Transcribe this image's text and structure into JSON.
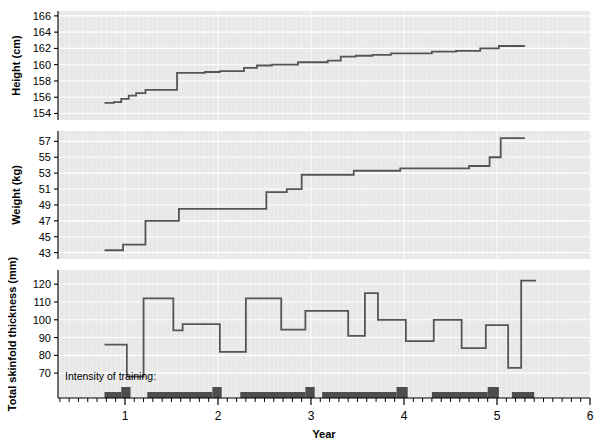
{
  "figure": {
    "background": "#ffffff",
    "panel_background": "#e8e8e8",
    "gridline_color": "#f7f7f7",
    "line_color": "#555555",
    "bar_color": "#4d4d4d",
    "axis_color": "#000000",
    "annotation": "Intensity of training:",
    "xlabel": "Year"
  },
  "chart_data": [
    {
      "type": "line",
      "id": "height",
      "title": "",
      "ylabel": "Height (cm)",
      "xlabel": "Year",
      "ylim": [
        153.2,
        166.6
      ],
      "xlim": [
        0.28,
        6.0
      ],
      "yticks": [
        154,
        156,
        158,
        160,
        162,
        164,
        166
      ],
      "grid": true,
      "drawstyle": "steps-post",
      "x": [
        0.78,
        0.88,
        0.96,
        1.04,
        1.12,
        1.22,
        1.34,
        1.56,
        1.74,
        1.86,
        2.02,
        2.14,
        2.28,
        2.42,
        2.58,
        2.74,
        2.86,
        2.96,
        3.06,
        3.18,
        3.32,
        3.48,
        3.66,
        3.86,
        4.06,
        4.3,
        4.56,
        4.82,
        5.02,
        5.16
      ],
      "y": [
        155.3,
        155.4,
        155.8,
        156.2,
        156.5,
        156.9,
        156.9,
        159.0,
        159.0,
        159.1,
        159.2,
        159.2,
        159.6,
        159.9,
        160.0,
        160.0,
        160.3,
        160.3,
        160.3,
        160.5,
        161.0,
        161.1,
        161.2,
        161.4,
        161.4,
        161.6,
        161.7,
        162.0,
        162.3,
        162.3
      ]
    },
    {
      "type": "line",
      "id": "weight",
      "title": "",
      "ylabel": "Weight (kg)",
      "xlabel": "Year",
      "ylim": [
        42.2,
        58.3
      ],
      "xlim": [
        0.28,
        6.0
      ],
      "yticks": [
        43,
        45,
        47,
        49,
        51,
        53,
        55,
        57
      ],
      "grid": true,
      "drawstyle": "steps-post",
      "x": [
        0.78,
        0.9,
        0.98,
        1.22,
        1.36,
        1.58,
        1.76,
        1.96,
        2.26,
        2.52,
        2.74,
        2.9,
        3.04,
        3.22,
        3.46,
        3.72,
        3.96,
        4.22,
        4.46,
        4.7,
        4.92,
        5.04,
        5.16
      ],
      "y": [
        43.3,
        43.3,
        44.0,
        47.0,
        47.0,
        48.5,
        48.5,
        48.5,
        48.5,
        50.6,
        51.0,
        52.8,
        52.8,
        52.8,
        53.3,
        53.3,
        53.6,
        53.6,
        53.6,
        53.9,
        55.0,
        57.4,
        57.4
      ]
    },
    {
      "type": "line",
      "id": "skinfold",
      "title": "",
      "ylabel": "Total skinfold thickness (mm)",
      "xlabel": "Year",
      "ylim": [
        56,
        128
      ],
      "xlim": [
        0.28,
        6.0
      ],
      "yticks": [
        70,
        80,
        90,
        100,
        110,
        120
      ],
      "grid": true,
      "drawstyle": "steps-post",
      "x": [
        0.78,
        0.94,
        1.02,
        1.2,
        1.34,
        1.52,
        1.62,
        1.94,
        2.02,
        2.14,
        2.3,
        2.48,
        2.68,
        2.78,
        2.94,
        3.06,
        3.24,
        3.4,
        3.58,
        3.72,
        3.88,
        4.02,
        4.16,
        4.32,
        4.46,
        4.62,
        4.88,
        4.98,
        5.12,
        5.26
      ],
      "y": [
        86,
        86,
        68,
        112,
        112,
        94,
        97.5,
        97.5,
        82,
        82,
        112,
        112,
        94.5,
        94.5,
        105,
        105,
        105,
        91,
        115,
        100,
        100,
        88,
        88,
        100,
        100,
        84,
        97,
        97,
        73,
        122
      ]
    },
    {
      "type": "bar",
      "id": "training-intensity",
      "title": "Intensity of training:",
      "xlabel": "Year",
      "xlim": [
        0.28,
        6.0
      ],
      "bars": [
        {
          "x0": 0.78,
          "x1": 0.96,
          "level": 1
        },
        {
          "x0": 0.96,
          "x1": 1.06,
          "level": 2
        },
        {
          "x0": 1.24,
          "x1": 1.94,
          "level": 1
        },
        {
          "x0": 1.94,
          "x1": 2.04,
          "level": 2
        },
        {
          "x0": 2.24,
          "x1": 2.94,
          "level": 1
        },
        {
          "x0": 2.94,
          "x1": 3.04,
          "level": 2
        },
        {
          "x0": 3.12,
          "x1": 3.92,
          "level": 1
        },
        {
          "x0": 3.92,
          "x1": 4.04,
          "level": 2
        },
        {
          "x0": 4.3,
          "x1": 4.9,
          "level": 1
        },
        {
          "x0": 4.9,
          "x1": 5.02,
          "level": 2
        },
        {
          "x0": 5.16,
          "x1": 5.4,
          "level": 1
        }
      ]
    }
  ],
  "xaxis": {
    "label": "Year",
    "ticks": [
      1,
      2,
      3,
      4,
      5,
      6
    ],
    "tick_labels": [
      "1",
      "2",
      "3",
      "4",
      "5",
      "6"
    ],
    "minor_tick_step": 0.1,
    "range": [
      0.28,
      6.0
    ]
  },
  "panels": [
    {
      "name": "height",
      "ylabel": "Height (cm)",
      "tick_labels": [
        "166",
        "164",
        "162",
        "160",
        "158",
        "156",
        "154"
      ]
    },
    {
      "name": "weight",
      "ylabel": "Weight (kg)",
      "tick_labels": [
        "57",
        "55",
        "53",
        "51",
        "49",
        "47",
        "45",
        "43"
      ]
    },
    {
      "name": "skinfold",
      "ylabel": "Total skinfold thickness (mm)",
      "tick_labels": [
        "120",
        "110",
        "100",
        "90",
        "80",
        "70"
      ]
    }
  ]
}
